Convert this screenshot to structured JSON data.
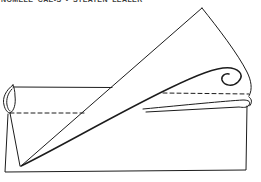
{
  "caption": {
    "text": "NOMELE CAE-S - STEATEN LEALER",
    "note_visible_state": "clipped-at-top-edge"
  },
  "colors": {
    "ink": "#1c1c1c",
    "background": "#ffffff",
    "caption": "#3d3d3d"
  },
  "diagram": {
    "kind": "paper-fold-line-drawing",
    "parts": [
      "base-sheet",
      "rolled-left-edge",
      "triangular-flap",
      "curled-flap-tip",
      "fold-line-dashed-left",
      "fold-line-dashed-right",
      "layered-fold-edge-right"
    ]
  }
}
